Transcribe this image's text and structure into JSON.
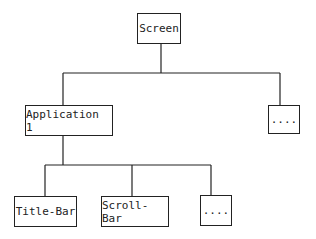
{
  "diagram": {
    "type": "tree",
    "root": {
      "id": "screen",
      "label": "Screen"
    },
    "level1": [
      {
        "id": "app1",
        "label": "Application 1"
      },
      {
        "id": "more-apps",
        "label": "...."
      }
    ],
    "level2": [
      {
        "id": "title-bar",
        "label": "Title-Bar",
        "parent": "app1"
      },
      {
        "id": "scroll-bar",
        "label": "Scroll-Bar",
        "parent": "app1"
      },
      {
        "id": "more-components",
        "label": "....",
        "parent": "app1"
      }
    ],
    "colors": {
      "stroke": "#222222",
      "background": "#ffffff"
    }
  }
}
